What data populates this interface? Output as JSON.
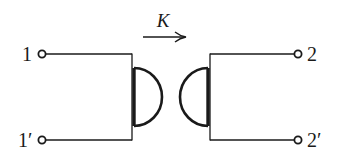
{
  "diagram": {
    "coupling": {
      "label": "K",
      "direction": "left-to-right"
    },
    "ports": {
      "left_top": "1",
      "left_bottom": "1′",
      "right_top": "2",
      "right_bottom": "2′"
    },
    "colors": {
      "line": "#1a1a1a",
      "background": "#ffffff"
    }
  }
}
